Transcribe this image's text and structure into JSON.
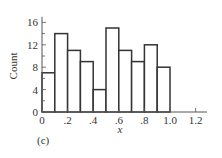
{
  "chart_data": {
    "type": "bar",
    "subtype": "histogram",
    "title": "",
    "panel_label": "(c)",
    "xlabel": "x",
    "ylabel": "Count",
    "bin_edges": [
      0.0,
      0.1,
      0.2,
      0.3,
      0.4,
      0.5,
      0.6,
      0.7,
      0.8,
      0.9,
      1.0
    ],
    "categories": [
      "0.0-0.1",
      "0.1-0.2",
      "0.2-0.3",
      "0.3-0.4",
      "0.4-0.5",
      "0.5-0.6",
      "0.6-0.7",
      "0.7-0.8",
      "0.8-0.9",
      "0.9-1.0"
    ],
    "values": [
      7,
      14,
      11,
      9,
      4,
      15,
      11,
      9,
      12,
      8
    ],
    "xlim": [
      0,
      1.25
    ],
    "ylim": [
      0,
      17
    ],
    "xticks": [
      0,
      0.2,
      0.4,
      0.6,
      0.8,
      1.0,
      1.2
    ],
    "xtick_labels": [
      "0",
      ".2",
      ".4",
      ".6",
      ".8",
      "1.0",
      "1.2"
    ],
    "yticks": [
      0,
      4,
      8,
      12,
      16
    ],
    "ytick_labels": [
      "0",
      "4",
      "8",
      "12",
      "16"
    ],
    "grid": false,
    "legend": null,
    "colors": {
      "bar_fill": "#ffffff",
      "bar_stroke": "#333333",
      "axis": "#555555"
    }
  }
}
